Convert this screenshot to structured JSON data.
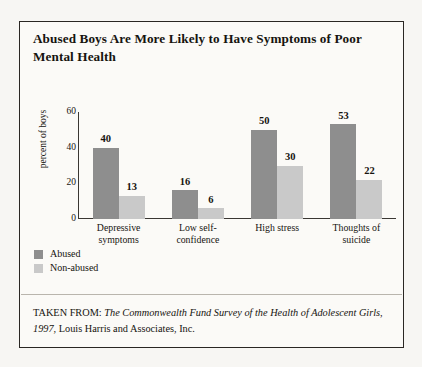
{
  "figure": {
    "title": "Abused Boys Are More Likely to Have Symptoms of Poor Mental Health",
    "source_prefix": "TAKEN FROM: ",
    "source_italic_1": "The Commonwealth Fund Survey of the Health of Adolescent Girls, 1997",
    "source_rest": ", Louis Harris and Associates, Inc."
  },
  "legend": {
    "items": [
      {
        "label": "Abused",
        "color": "#8e8e8e"
      },
      {
        "label": "Non-abused",
        "color": "#c9c9c9"
      }
    ]
  },
  "chart_data": {
    "type": "bar",
    "title": "Abused Boys Are More Likely to Have Symptoms of Poor Mental Health",
    "xlabel": "",
    "ylabel": "percent of boys",
    "ylim": [
      0,
      60
    ],
    "yticks": [
      0,
      20,
      40,
      60
    ],
    "grid": false,
    "legend_position": "below-left",
    "categories": [
      "Depressive symptoms",
      "Low self-confidence",
      "High stress",
      "Thoughts of suicide"
    ],
    "category_lines": [
      [
        "Depressive",
        "symptoms"
      ],
      [
        "Low self-",
        "confidence"
      ],
      [
        "High stress",
        ""
      ],
      [
        "Thoughts of",
        "suicide"
      ]
    ],
    "series": [
      {
        "name": "Abused",
        "color": "#8e8e8e",
        "values": [
          40,
          16,
          50,
          53
        ]
      },
      {
        "name": "Non-abused",
        "color": "#c9c9c9",
        "values": [
          13,
          6,
          30,
          22
        ]
      }
    ]
  }
}
